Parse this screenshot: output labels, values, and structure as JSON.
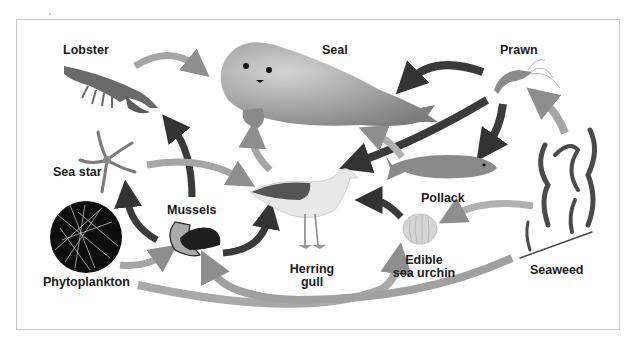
{
  "diagram": {
    "type": "food-web",
    "organisms": [
      {
        "id": "lobster",
        "label": "Lobster"
      },
      {
        "id": "seal",
        "label": "Seal"
      },
      {
        "id": "prawn",
        "label": "Prawn"
      },
      {
        "id": "sea_star",
        "label": "Sea star"
      },
      {
        "id": "mussels",
        "label": "Mussels"
      },
      {
        "id": "pollack",
        "label": "Pollack"
      },
      {
        "id": "phytoplankton",
        "label": "Phytoplankton"
      },
      {
        "id": "herring_gull",
        "label_line1": "Herring",
        "label_line2": "gull"
      },
      {
        "id": "sea_urchin",
        "label_line1": "Edible",
        "label_line2": "sea urchin"
      },
      {
        "id": "seaweed",
        "label": "Seaweed"
      }
    ],
    "arrows": [
      {
        "from": "lobster",
        "to": "seal",
        "style": "light"
      },
      {
        "from": "prawn",
        "to": "seal",
        "style": "dark"
      },
      {
        "from": "prawn",
        "to": "herring_gull",
        "style": "dark"
      },
      {
        "from": "prawn",
        "to": "pollack",
        "style": "dark"
      },
      {
        "from": "seaweed",
        "to": "prawn",
        "style": "light"
      },
      {
        "from": "pollack",
        "to": "seal",
        "style": "light"
      },
      {
        "from": "mussels",
        "to": "lobster",
        "style": "dark"
      },
      {
        "from": "sea_star",
        "to": "herring_gull",
        "style": "light"
      },
      {
        "from": "mussels",
        "to": "sea_star",
        "style": "dark"
      },
      {
        "from": "mussels",
        "to": "herring_gull",
        "style": "dark"
      },
      {
        "from": "herring_gull",
        "to": "seal",
        "style": "light"
      },
      {
        "from": "sea_urchin",
        "to": "herring_gull",
        "style": "dark"
      },
      {
        "from": "seaweed",
        "to": "sea_urchin",
        "style": "light"
      },
      {
        "from": "phytoplankton",
        "to": "mussels",
        "style": "light"
      },
      {
        "from": "phytoplankton",
        "to": "sea_urchin",
        "style": "light"
      },
      {
        "from": "seaweed",
        "to": "mussels",
        "style": "light"
      }
    ],
    "colors": {
      "dark_arrow": "#3a3a3a",
      "light_arrow": "#a8a8a8",
      "frame": "#c8c8c8",
      "text": "#1a1a1a"
    }
  }
}
